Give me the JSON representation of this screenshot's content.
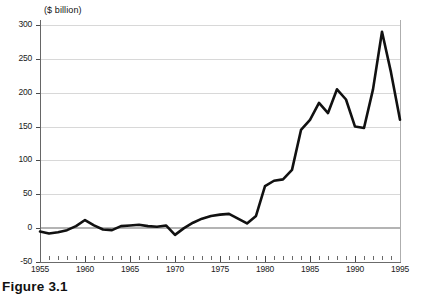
{
  "figure": {
    "caption": "Figure 3.1",
    "unit_label": "($  billion)"
  },
  "chart_data": {
    "type": "line",
    "title": "",
    "subtitle": "",
    "xlabel": "",
    "ylabel": "($ billion)",
    "unit": "$ billion",
    "grid": true,
    "legend_position": "none",
    "xlim": [
      1955,
      1995
    ],
    "ylim": [
      -50,
      300
    ],
    "ytick_values": [
      -50,
      0,
      50,
      100,
      150,
      200,
      250,
      300
    ],
    "ytick_labels": [
      "-50",
      "0",
      "50",
      "100",
      "150",
      "200",
      "250",
      "300"
    ],
    "xtick_values": [
      1955,
      1960,
      1965,
      1970,
      1975,
      1980,
      1985,
      1990,
      1995
    ],
    "xtick_labels": [
      "1955",
      "1960",
      "1965",
      "1970",
      "1975",
      "1980",
      "1985",
      "1990",
      "1995"
    ],
    "minor_xticks_every": 1,
    "line_color": "#111111",
    "line_width": 2.6,
    "zero_line_color": "#b4b4b4",
    "grid_color": "#d8d8d8",
    "x": [
      1955,
      1956,
      1957,
      1958,
      1959,
      1960,
      1961,
      1962,
      1963,
      1964,
      1965,
      1966,
      1967,
      1968,
      1969,
      1970,
      1971,
      1972,
      1973,
      1974,
      1975,
      1976,
      1977,
      1978,
      1979,
      1980,
      1981,
      1982,
      1983,
      1984,
      1985,
      1986,
      1987,
      1988,
      1989,
      1990,
      1991,
      1992,
      1993,
      1994,
      1995
    ],
    "series": [
      {
        "name": "Flow",
        "values": [
          -5,
          -8,
          -6,
          -3,
          3,
          12,
          4,
          -2,
          -3,
          3,
          4,
          5,
          3,
          2,
          4,
          -10,
          0,
          8,
          14,
          18,
          20,
          21,
          14,
          7,
          18,
          62,
          70,
          72,
          86,
          145,
          160,
          185,
          170,
          205,
          190,
          150,
          148,
          205,
          290,
          230,
          160
        ]
      }
    ]
  }
}
